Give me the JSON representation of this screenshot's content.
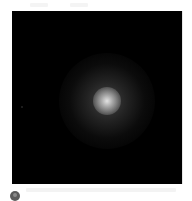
{
  "image": {
    "description": "Dark field with a diffuse glowing luminous blob near the center",
    "background_color": "#000000",
    "glow_core_color": "#ebebeb",
    "glow_halo_color": "#787878"
  },
  "caption": {
    "icon": "avatar-icon",
    "icon_color": "#5a5a5a"
  }
}
